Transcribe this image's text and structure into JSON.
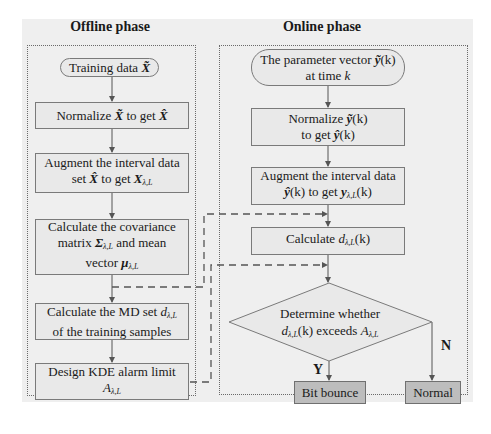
{
  "phases": {
    "offline": {
      "title": "Offline phase",
      "steps": [
        {
          "id": "training-data",
          "shape": "oval",
          "lines": [
            "Training data X̃"
          ]
        },
        {
          "id": "normalize",
          "shape": "rect",
          "lines": [
            "Normalize X̃ to get X̂"
          ]
        },
        {
          "id": "augment",
          "shape": "rect",
          "lines": [
            "Augment the interval data",
            "set X̂ to get X λ,L"
          ]
        },
        {
          "id": "covariance",
          "shape": "rect",
          "lines": [
            "Calculate the covariance",
            "matrix Σ λ,L and mean",
            "vector μ λ,L"
          ]
        },
        {
          "id": "md-set",
          "shape": "rect",
          "lines": [
            "Calculate the MD set d λ,L",
            "of the training samples"
          ]
        },
        {
          "id": "kde-limit",
          "shape": "rect",
          "lines": [
            "Design KDE alarm limit",
            "A λ,L"
          ]
        }
      ]
    },
    "online": {
      "title": "Online phase",
      "steps": [
        {
          "id": "parameter-vector",
          "shape": "oval",
          "lines": [
            "The parameter vector ỹ(k)",
            "at time k"
          ]
        },
        {
          "id": "normalize",
          "shape": "rect",
          "lines": [
            "Normalize ỹ(k)",
            "to get ŷ(k)"
          ]
        },
        {
          "id": "augment",
          "shape": "rect",
          "lines": [
            "Augment the interval data",
            "ŷ(k) to get y λ,L(k)"
          ]
        },
        {
          "id": "calculate-d",
          "shape": "rect",
          "lines": [
            "Calculate d λ,L(k)"
          ]
        },
        {
          "id": "decision",
          "shape": "diamond",
          "lines": [
            "Determine whether",
            "d λ,L(k) exceeds A λ,L"
          ]
        },
        {
          "id": "bit-bounce",
          "shape": "result",
          "lines": [
            "Bit bounce"
          ]
        },
        {
          "id": "normal",
          "shape": "result",
          "lines": [
            "Normal"
          ]
        }
      ],
      "branches": {
        "yes": "Y",
        "no": "N"
      }
    }
  },
  "text": {
    "offline_title": "Offline phase",
    "online_title": "Online phase",
    "off_training_pre": "Training data ",
    "off_training_sym": "X̃",
    "off_norm_pre": "Normalize ",
    "off_norm_sym1": "X̃",
    "off_norm_mid": " to get ",
    "off_norm_sym2": "X̂",
    "off_aug_l1": "Augment the interval  data",
    "off_aug_pre": "set ",
    "off_aug_sym1": "X̂",
    "off_aug_mid": " to get ",
    "off_aug_sym2": "X",
    "sub_lambda_l": "λ,L",
    "off_cov_l1": "Calculate the covariance",
    "off_cov_pre": "matrix ",
    "off_cov_sym": "Σ",
    "off_cov_post": " and  mean",
    "off_cov_l3_pre": "vector ",
    "off_cov_l3_sym": "μ",
    "off_md_pre": "Calculate the MD set ",
    "off_md_sym": "d",
    "off_md_l2": "of the training samples",
    "off_kde_l1": "Design KDE alarm limit",
    "off_kde_sym": "A",
    "on_param_pre": "The  parameter vector ",
    "on_param_sym": "ỹ",
    "on_param_k": "(k)",
    "on_param_l2_pre": "at time ",
    "on_param_l2_k": "k",
    "on_norm_pre": "Normalize ",
    "on_norm_sym": "ỹ",
    "on_norm_k": "(k)",
    "on_norm_l2_pre": "to get ",
    "on_norm_l2_sym": "ŷ",
    "on_norm_l2_k": "(k)",
    "on_aug_l1": "Augment the interval data",
    "on_aug_sym1": "ŷ",
    "on_aug_k1": "(k)",
    "on_aug_mid": " to get ",
    "on_aug_sym2": "y",
    "on_aug_k2": "(k)",
    "on_calc_pre": "Calculate  ",
    "on_calc_sym": "d",
    "on_calc_k": "(k)",
    "on_dec_l1": "Determine whether",
    "on_dec_sym1": "d",
    "on_dec_k": "(k)",
    "on_dec_mid": " exceeds ",
    "on_dec_sym2": "A",
    "on_bit_bounce": "Bit bounce",
    "on_normal": "Normal",
    "branch_yes": "Y",
    "branch_no": "N"
  },
  "colors": {
    "background": "#efefef",
    "node_fill": "#e9e9e9",
    "result_fill": "#bdbdbd",
    "border": "#7a7a7a",
    "arrow": "#555555"
  }
}
